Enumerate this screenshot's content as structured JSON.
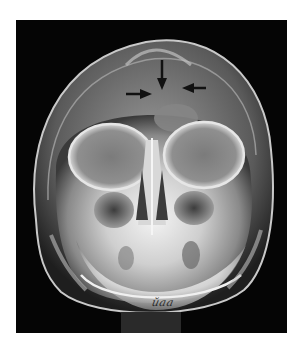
{
  "figure": {
    "type": "radiograph",
    "view": "frontal skull X-ray",
    "background_color": "#050505",
    "bone_color": "#e8e8e8",
    "arrows": [
      {
        "name": "arrow-down",
        "direction": "down",
        "tip": [
          162,
          79
        ]
      },
      {
        "name": "arrow-right",
        "direction": "right",
        "tip": [
          148,
          92
        ]
      },
      {
        "name": "arrow-left",
        "direction": "left",
        "tip": [
          182,
          87
        ]
      }
    ],
    "arrow_color": "#111111",
    "marking_text": "ŭaa"
  }
}
